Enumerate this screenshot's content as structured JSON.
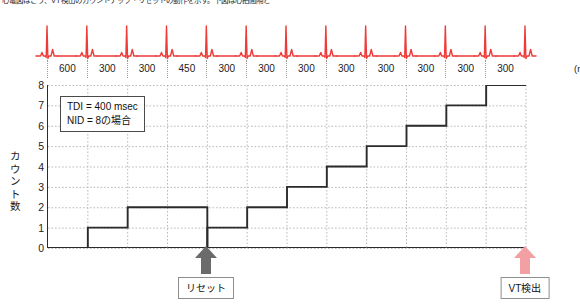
{
  "caption": "心電図はこう、VT検出のカウントアップ・リセットの動作を示す。下図は心拍間隔と",
  "chart_data": {
    "type": "line",
    "title": "",
    "xlabel": "(msec)",
    "ylabel": "カウント数",
    "ylim": [
      0,
      8
    ],
    "ytick_labels": [
      "0",
      "1",
      "2",
      "3",
      "4",
      "5",
      "6",
      "7",
      "8"
    ],
    "grid": true,
    "intervals": [
      "600",
      "300",
      "300",
      "450",
      "300",
      "300",
      "300",
      "300",
      "300",
      "300",
      "300",
      "300"
    ],
    "interval_unit": "(msec)",
    "annotation_box": {
      "line1": "TDI = 400 msec",
      "line2": "NID = 8の場合"
    },
    "series": [
      {
        "name": "count-segment-1",
        "points": [
          [
            1,
            0
          ],
          [
            1,
            1
          ],
          [
            2,
            1
          ],
          [
            2,
            2
          ],
          [
            4,
            2
          ],
          [
            4,
            0
          ]
        ]
      },
      {
        "name": "count-segment-2",
        "points": [
          [
            4,
            0
          ],
          [
            4,
            1
          ],
          [
            5,
            1
          ],
          [
            5,
            2
          ],
          [
            6,
            2
          ],
          [
            6,
            3
          ],
          [
            7,
            3
          ],
          [
            7,
            4
          ],
          [
            8,
            4
          ],
          [
            8,
            5
          ],
          [
            9,
            5
          ],
          [
            9,
            6
          ],
          [
            10,
            6
          ],
          [
            10,
            7
          ],
          [
            11,
            7
          ],
          [
            11,
            8
          ],
          [
            12,
            8
          ]
        ]
      }
    ],
    "markers": [
      {
        "name": "reset",
        "label": "リセット",
        "x_index": 4,
        "color": "#6b6b6b"
      },
      {
        "name": "vt-detect",
        "label": "VT検出",
        "x_index": 12,
        "color": "#f2a0a3"
      }
    ],
    "ecg": {
      "name": "ecg-waveform",
      "color": "#ef3b38",
      "beat_positions": [
        0,
        1,
        2,
        3,
        4,
        5,
        6,
        7,
        8,
        9,
        10,
        11,
        12
      ],
      "beat_count": 13
    }
  },
  "colors": {
    "ecg": "#ef3b38",
    "step_line": "#2b2b2b",
    "grid": "#a8a8a8",
    "reset_arrow": "#6b6b6b",
    "vt_arrow": "#f2a0a3"
  }
}
